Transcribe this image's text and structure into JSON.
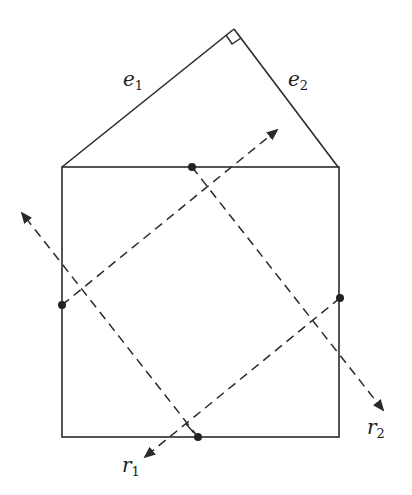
{
  "labels": {
    "e1": {
      "main": "e",
      "sub": "1"
    },
    "e2": {
      "main": "e",
      "sub": "2"
    },
    "r1": {
      "main": "r",
      "sub": "1"
    },
    "r2": {
      "main": "r",
      "sub": "2"
    }
  },
  "colors": {
    "stroke": "#2a2a2a",
    "background": "#ffffff"
  }
}
